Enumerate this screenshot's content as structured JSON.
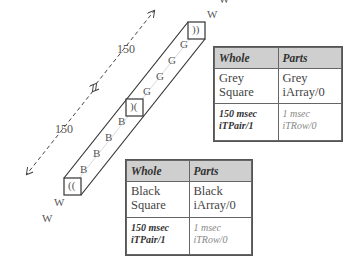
{
  "distances": [
    {
      "label": "150"
    },
    {
      "label": "150"
    }
  ],
  "tube": {
    "end_top": {
      "label": "))"
    },
    "middle": {
      "label": ")("
    },
    "end_bottom": {
      "label": "(("
    },
    "grey_letters": [
      "G",
      "G",
      "G",
      "G"
    ],
    "black_letters": [
      "B",
      "B",
      "B",
      "B"
    ]
  },
  "w_labels": [
    "W",
    "W",
    "W",
    "W"
  ],
  "grey_table": {
    "headers": [
      "Whole",
      "Parts"
    ],
    "row1": {
      "whole": [
        "Grey",
        "Square"
      ],
      "parts": [
        "Grey",
        "iArray/0"
      ]
    },
    "row2": {
      "whole": [
        "150 msec",
        "iTPair/1"
      ],
      "parts": [
        "1 msec",
        "iTRow/0"
      ]
    }
  },
  "black_table": {
    "headers": [
      "Whole",
      "Parts"
    ],
    "row1": {
      "whole": [
        "Black",
        "Square"
      ],
      "parts": [
        "Black",
        "iArray/0"
      ]
    },
    "row2": {
      "whole": [
        "150 msec",
        "iTPair/1"
      ],
      "parts": [
        "1 msec",
        "iTRow/0"
      ]
    }
  },
  "colors": {
    "header_bg": "#cfcfcf",
    "line": "#333333",
    "dashed": "#444444"
  }
}
